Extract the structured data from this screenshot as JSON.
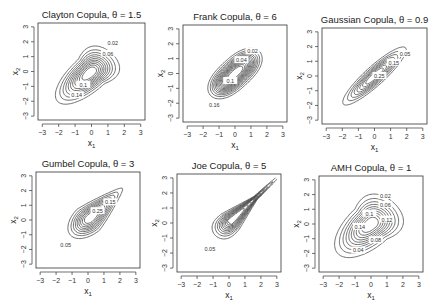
{
  "figure": {
    "layout": "2x3 grid of bivariate copula density contour plots",
    "line_color": "#333333",
    "background": "#ffffff"
  },
  "chart_data": [
    {
      "type": "contour",
      "title": "Clayton Copula, θ = 1.5",
      "family": "clayton",
      "theta": 1.5,
      "xlabel": "x1",
      "ylabel": "x2",
      "xlim": [
        -3,
        3
      ],
      "ylim": [
        -3,
        3
      ],
      "xticks": [
        -3,
        -2,
        -1,
        0,
        1,
        2,
        3
      ],
      "yticks": [
        -3,
        -2,
        -1,
        0,
        1,
        2,
        3
      ],
      "contour_labels": [
        "0.02",
        "0.06",
        "0.1",
        "0.14"
      ],
      "shape": "teardrop with lower-left tail",
      "box": [
        38,
        23,
        145,
        120
      ]
    },
    {
      "type": "contour",
      "title": "Frank Copula, θ = 6",
      "family": "frank",
      "theta": 6,
      "xlabel": "x1",
      "ylabel": "x2",
      "xlim": [
        -3,
        3
      ],
      "ylim": [
        -3,
        3
      ],
      "xticks": [
        -3,
        -2,
        -1,
        0,
        1,
        2,
        3
      ],
      "yticks": [
        -3,
        -2,
        -1,
        0,
        1,
        2,
        3
      ],
      "contour_labels": [
        "0.02",
        "0.04",
        "0.1",
        "0.16"
      ],
      "shape": "symmetric elongated oval along diagonal",
      "box": [
        183,
        25,
        287,
        122
      ]
    },
    {
      "type": "contour",
      "title": "Gaussian Copula, θ = 0.9",
      "family": "gaussian",
      "theta": 0.9,
      "xlabel": "x1",
      "ylabel": "x2",
      "xlim": [
        -3,
        3
      ],
      "ylim": [
        -3,
        3
      ],
      "xticks": [
        -3,
        -2,
        -1,
        0,
        1,
        2,
        3
      ],
      "yticks": [
        -3,
        -2,
        -1,
        0,
        1,
        2,
        3
      ],
      "contour_labels": [
        "0.05",
        "0.15",
        "0.25"
      ],
      "shape": "narrow ellipse along diagonal",
      "box": [
        322,
        28,
        427,
        124
      ]
    },
    {
      "type": "contour",
      "title": "Gumbel Copula, θ = 3",
      "family": "gumbel",
      "theta": 3,
      "xlabel": "x1",
      "ylabel": "x2",
      "xlim": [
        -3,
        3
      ],
      "ylim": [
        -3,
        3
      ],
      "xticks": [
        -3,
        -2,
        -1,
        0,
        1,
        2,
        3
      ],
      "yticks": [
        -3,
        -2,
        -1,
        0,
        1,
        2,
        3
      ],
      "contour_labels": [
        "0.05",
        "0.15",
        "0.25"
      ],
      "shape": "teardrop with upper-right tail",
      "box": [
        36,
        172,
        140,
        268
      ]
    },
    {
      "type": "contour",
      "title": "Joe Copula, θ = 5",
      "family": "joe",
      "theta": 5,
      "xlabel": "x1",
      "ylabel": "x2",
      "xlim": [
        -3,
        3
      ],
      "ylim": [
        -3,
        3
      ],
      "xticks": [
        -3,
        -2,
        -1,
        0,
        1,
        2,
        3
      ],
      "yticks": [
        -3,
        -2,
        -1,
        0,
        1,
        2,
        3
      ],
      "contour_labels": [
        "0.05"
      ],
      "shape": "sharp spike toward upper right",
      "box": [
        177,
        174,
        281,
        272
      ]
    },
    {
      "type": "contour",
      "title": "AMH Copula, θ = 1",
      "family": "amh",
      "theta": 1,
      "xlabel": "x1",
      "ylabel": "x2",
      "xlim": [
        -3,
        3
      ],
      "ylim": [
        -3,
        3
      ],
      "xticks": [
        -3,
        -2,
        -1,
        0,
        1,
        2,
        3
      ],
      "yticks": [
        -3,
        -2,
        -1,
        0,
        1,
        2,
        3
      ],
      "contour_labels": [
        "0.02",
        "0.06",
        "0.1",
        "0.14",
        "0.12",
        "0.08",
        "0.04"
      ],
      "shape": "teardrop with lower-left tail",
      "box": [
        319,
        176,
        423,
        272
      ]
    }
  ]
}
